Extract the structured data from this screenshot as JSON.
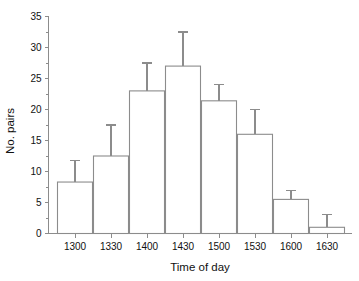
{
  "chart_data": {
    "type": "bar",
    "title": "",
    "subtitle": "",
    "xlabel": "Time of day",
    "ylabel": "No. pairs",
    "categories": [
      "1300",
      "1330",
      "1400",
      "1430",
      "1500",
      "1530",
      "1600",
      "1630"
    ],
    "values": [
      8.3,
      12.5,
      23.0,
      27.0,
      21.4,
      16.0,
      5.5,
      1.0
    ],
    "error_upper": [
      3.5,
      5.0,
      4.5,
      5.5,
      2.6,
      4.0,
      1.5,
      2.0
    ],
    "error_top_values": [
      11.8,
      17.5,
      27.5,
      32.5,
      24.0,
      20.0,
      7.0,
      3.0
    ],
    "ylim": [
      0,
      35
    ],
    "xlim_note": "categorical, contiguous bars",
    "ytick_labels": [
      "0",
      "5",
      "10",
      "15",
      "20",
      "25",
      "30",
      "35"
    ],
    "ytick_values": [
      0,
      5,
      10,
      15,
      20,
      25,
      30,
      35
    ],
    "yminor_step": 2.5,
    "grid": false,
    "legend": null,
    "legend_position": "none",
    "bar_fill_color": "#ffffff",
    "bar_edge_color": "#8c8c8c",
    "error_bar_color": "#8c8c8c",
    "axis_color": "#8c8c8c",
    "text_color": "#111111",
    "background_color": "#ffffff",
    "error_style": "upper-whisker-only"
  }
}
